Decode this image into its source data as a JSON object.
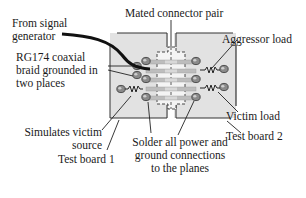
{
  "diagram": {
    "labels": {
      "from_signal_generator": [
        "From signal",
        "generator"
      ],
      "mated_connector_pair": "Mated connector pair",
      "aggressor_load": "Aggressor load",
      "coax_braid": [
        "RG174 coaxial",
        "braid grounded in",
        "two places"
      ],
      "victim_load": "Victim load",
      "simulates_victim_source": [
        "Simulates victim",
        "source"
      ],
      "test_board_2": "Test board 2",
      "test_board_1": "Test board 1",
      "solder_note": [
        "Solder all power and",
        "ground connections",
        "to the planes"
      ]
    },
    "colors": {
      "board_fill": "#e2e2e2",
      "board_edge": "#333333",
      "trace": "#bdbdbd",
      "pad": "#7a7a7a",
      "coax": "#111111",
      "text": "#1a1a1a"
    },
    "elements": {
      "boards": [
        "Test board 1",
        "Test board 2"
      ],
      "connector_traces": 5,
      "resistors": [
        "Aggressor load",
        "Victim load",
        "Simulates victim source"
      ]
    }
  }
}
